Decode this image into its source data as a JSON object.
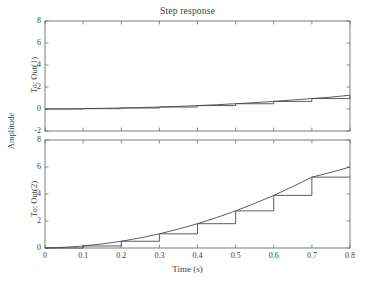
{
  "figure": {
    "title": "Step response",
    "xlabel": "Time (s)",
    "ylabel_outer": "Amplitude",
    "panel1_ylabel": "To: Out(1)",
    "panel2_ylabel": "To: Out(2)",
    "line_color": "#4a4a4a",
    "axis_color": "#6e6e6e",
    "background": "#ffffff"
  },
  "chart_data": [
    {
      "type": "line",
      "title": "Step response",
      "subtitle": "To: Out(1)",
      "xlabel": "Time (s)",
      "ylabel": "Amplitude",
      "xlim": [
        0,
        0.8
      ],
      "ylim": [
        -2,
        8
      ],
      "xticks": [
        0,
        0.1,
        0.2,
        0.3,
        0.4,
        0.5,
        0.6,
        0.7,
        0.8
      ],
      "xticklabels": [
        "0",
        "0.1",
        "0.2",
        "0.3",
        "0.4",
        "0.5",
        "0.6",
        "0.7",
        "0.8"
      ],
      "yticks": [
        -2,
        0,
        2,
        4,
        6,
        8
      ],
      "yticklabels": [
        "-2",
        "0",
        "2",
        "4",
        "6",
        "8"
      ],
      "grid": false,
      "legend": "none",
      "series": [
        {
          "name": "continuous",
          "style": "solid",
          "x": [
            0,
            0.05,
            0.1,
            0.15,
            0.2,
            0.25,
            0.3,
            0.35,
            0.4,
            0.45,
            0.5,
            0.55,
            0.6,
            0.65,
            0.7,
            0.75,
            0.8
          ],
          "y": [
            0.0,
            0.01,
            0.03,
            0.06,
            0.09,
            0.13,
            0.18,
            0.24,
            0.31,
            0.39,
            0.48,
            0.58,
            0.69,
            0.82,
            0.95,
            1.08,
            1.25
          ]
        },
        {
          "name": "discrete-zoh",
          "style": "stairs",
          "x": [
            0,
            0.1,
            0.2,
            0.3,
            0.4,
            0.5,
            0.6,
            0.7,
            0.8
          ],
          "y": [
            0.0,
            0.03,
            0.09,
            0.18,
            0.31,
            0.48,
            0.69,
            0.95,
            1.2
          ]
        }
      ]
    },
    {
      "type": "line",
      "subtitle": "To: Out(2)",
      "xlabel": "Time (s)",
      "ylabel": "Amplitude",
      "xlim": [
        0,
        0.8
      ],
      "ylim": [
        0,
        8
      ],
      "xticks": [
        0,
        0.1,
        0.2,
        0.3,
        0.4,
        0.5,
        0.6,
        0.7,
        0.8
      ],
      "xticklabels": [
        "0",
        "0.1",
        "0.2",
        "0.3",
        "0.4",
        "0.5",
        "0.6",
        "0.7",
        "0.8"
      ],
      "yticks": [
        0,
        2,
        4,
        6,
        8
      ],
      "yticklabels": [
        "0",
        "2",
        "4",
        "6",
        "8"
      ],
      "grid": false,
      "legend": "none",
      "series": [
        {
          "name": "continuous",
          "style": "solid",
          "x": [
            0,
            0.05,
            0.1,
            0.15,
            0.2,
            0.25,
            0.3,
            0.35,
            0.4,
            0.45,
            0.5,
            0.55,
            0.6,
            0.65,
            0.7,
            0.75,
            0.8
          ],
          "y": [
            0.0,
            0.05,
            0.15,
            0.3,
            0.5,
            0.75,
            1.05,
            1.4,
            1.8,
            2.25,
            2.75,
            3.3,
            3.9,
            4.55,
            5.25,
            5.6,
            6.0
          ]
        },
        {
          "name": "discrete-zoh",
          "style": "stairs",
          "x": [
            0,
            0.1,
            0.2,
            0.3,
            0.4,
            0.5,
            0.6,
            0.7,
            0.8
          ],
          "y": [
            0.0,
            0.15,
            0.5,
            1.05,
            1.8,
            2.75,
            3.9,
            5.25,
            5.25
          ]
        }
      ]
    }
  ]
}
